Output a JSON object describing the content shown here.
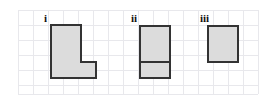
{
  "figure": {
    "title": "",
    "background_color": "#ffffff",
    "width": 275,
    "height": 107
  },
  "grid": {
    "name": "square-grid",
    "line_color": "#e8e8ec",
    "line_width": 1,
    "cell_size": 15,
    "origin_x": 18,
    "origin_y": 10,
    "columns": 16,
    "rows": 5.6,
    "right_edge": 258,
    "bottom_edge": 94
  },
  "style": {
    "shape_fill": "#dcdcdc",
    "shape_stroke": "#333333",
    "shape_stroke_width": 2,
    "divider_stroke": "#333333",
    "divider_stroke_width": 2,
    "label_color": "#111111"
  },
  "labels": {
    "i": "i",
    "ii": "ii",
    "iii": "iii"
  },
  "shapes": [
    {
      "id": "shape-i",
      "label": "i",
      "type": "L-shape polygon",
      "grid_cells": 5,
      "points": "51,25 81,25 81,62 96,62 96,78 51,78",
      "dividers": []
    },
    {
      "id": "shape-ii",
      "label": "ii",
      "type": "rectangle with horizontal divider",
      "grid_cells": 4,
      "points": "140,26 170,26 170,78 140,78",
      "dividers": [
        {
          "x1": 140,
          "y1": 62,
          "x2": 170,
          "y2": 62
        }
      ]
    },
    {
      "id": "shape-iii",
      "label": "iii",
      "type": "rectangle",
      "grid_cells": 2,
      "points": "208,26 238,26 238,62 208,62",
      "dividers": []
    }
  ]
}
